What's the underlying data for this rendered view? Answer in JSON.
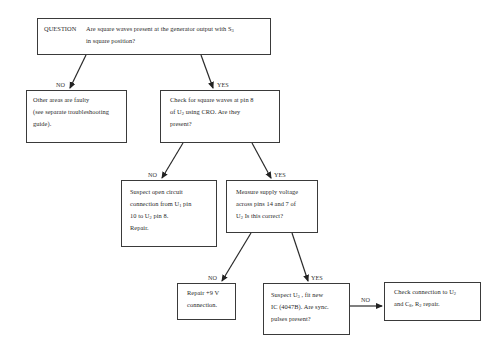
{
  "diagram": {
    "type": "troubleshooting-flowchart",
    "nodes": {
      "question": {
        "keyword": "QUESTION",
        "lines": [
          "Are square waves present at the generator output with S",
          "in square position?"
        ],
        "subscripts": [
          "3"
        ]
      },
      "other_areas": {
        "lines": [
          "Other areas are faulty",
          "(see separate troubleshooting",
          "guide)."
        ]
      },
      "check_pin8": {
        "lines": [
          "Check for square waves at pin 8",
          "of U",
          " using CRO.  Are they",
          "present?"
        ],
        "subscripts": [
          "2"
        ]
      },
      "suspect_open": {
        "lines": [
          "Suspect open circuit",
          "connection from U",
          " pin",
          "10 to U",
          " pin 8.",
          "Repair."
        ],
        "subscripts": [
          "1",
          "2"
        ]
      },
      "measure_supply": {
        "lines": [
          "Measure supply voltage",
          "across pins 14 and 7 of",
          "U",
          " Is this correct?"
        ],
        "subscripts": [
          "2"
        ]
      },
      "repair_9v": {
        "lines": [
          "Repair +9 V",
          "connection."
        ]
      },
      "suspect_u3": {
        "lines": [
          "Suspect U",
          " , fit new",
          "IC (4047B).  Are sync.",
          "pulses present?"
        ],
        "subscripts": [
          "3"
        ]
      },
      "check_connection": {
        "lines": [
          "Check connection to U",
          "and C",
          ", R",
          " repair."
        ],
        "subscripts": [
          "2",
          "8",
          "2"
        ]
      }
    },
    "edge_labels": {
      "q_no": "NO",
      "q_yes": "YES",
      "pin8_no": "NO",
      "pin8_yes": "YES",
      "supply_no": "NO",
      "supply_yes": "YES",
      "u3_no": "NO"
    },
    "edges": [
      {
        "from": "question",
        "to": "other_areas",
        "label": "NO"
      },
      {
        "from": "question",
        "to": "check_pin8",
        "label": "YES"
      },
      {
        "from": "check_pin8",
        "to": "suspect_open",
        "label": "NO"
      },
      {
        "from": "check_pin8",
        "to": "measure_supply",
        "label": "YES"
      },
      {
        "from": "measure_supply",
        "to": "repair_9v",
        "label": "NO"
      },
      {
        "from": "measure_supply",
        "to": "suspect_u3",
        "label": "YES"
      },
      {
        "from": "suspect_u3",
        "to": "check_connection",
        "label": "NO"
      }
    ],
    "colors": {
      "line": "#2a2a2a",
      "text": "#2a2a2a",
      "background": "#ffffff"
    }
  }
}
